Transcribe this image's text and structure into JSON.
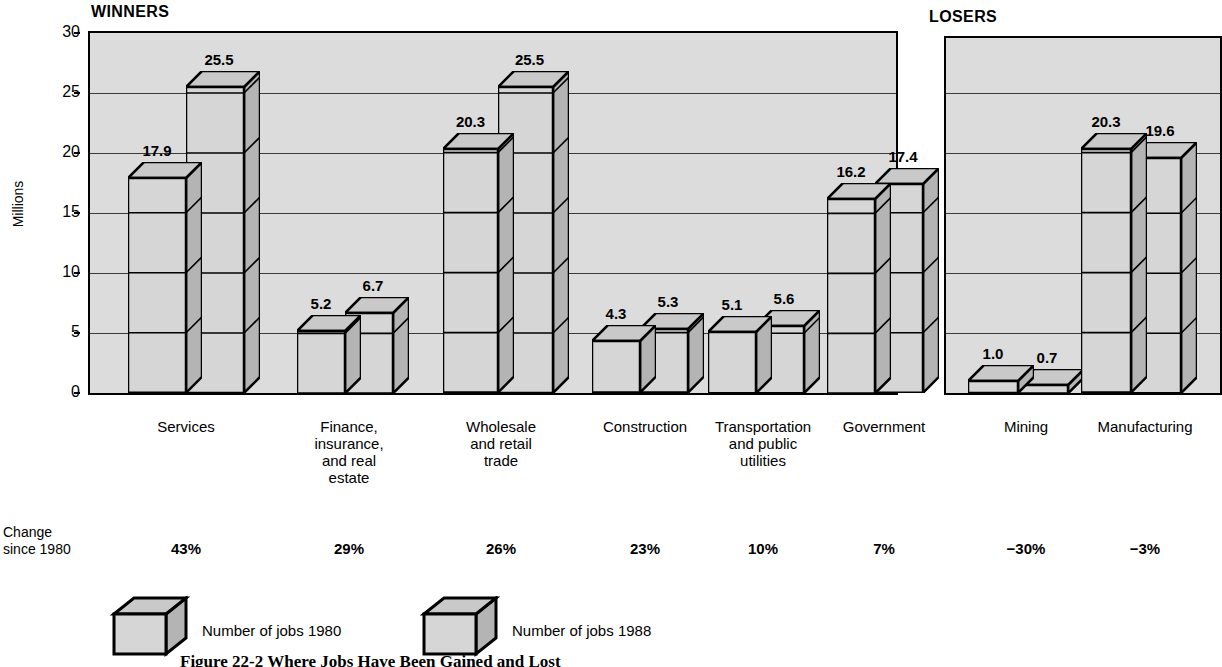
{
  "figure": {
    "ylabel": "Millions",
    "caption": "Figure 22-2   Where Jobs Have Been Gained and Lost",
    "change_label": "Change\nsince 1980",
    "panels": [
      {
        "name": "winners",
        "title": "WINNERS"
      },
      {
        "name": "losers",
        "title": "LOSERS"
      }
    ],
    "legend": [
      {
        "name": "legend-1980",
        "label": "Number of jobs 1980"
      },
      {
        "name": "legend-1988",
        "label": "Number of jobs 1988"
      }
    ]
  },
  "chart_data": {
    "type": "bar",
    "title": "Where Jobs Have Been Gained and Lost",
    "subtitle": "",
    "xlabel": "",
    "ylabel": "Millions",
    "ylim": [
      0,
      30
    ],
    "yticks": [
      0,
      5,
      10,
      15,
      20,
      25,
      30
    ],
    "grid": true,
    "legend_position": "bottom-left",
    "series": [
      {
        "name": "Number of jobs 1980",
        "values": [
          17.9,
          5.2,
          20.3,
          4.3,
          5.1,
          16.2,
          1.0,
          20.3
        ]
      },
      {
        "name": "Number of jobs 1988",
        "values": [
          25.5,
          6.7,
          25.5,
          5.3,
          5.6,
          17.4,
          0.7,
          19.6
        ]
      }
    ],
    "categories": [
      "Services",
      "Finance,\ninsurance,\nand real\nestate",
      "Wholesale\nand retail\ntrade",
      "Construction",
      "Transportation\nand public\nutilities",
      "Government",
      "Mining",
      "Manufacturing"
    ],
    "annotations": {
      "change_since_1980": [
        "43%",
        "29%",
        "26%",
        "23%",
        "10%",
        "7%",
        "−30%",
        "−3%"
      ]
    },
    "groups": [
      {
        "label": "WINNERS",
        "categories": [
          "Services",
          "Finance, insurance, and real estate",
          "Wholesale and retail trade",
          "Construction",
          "Transportation and public utilities",
          "Government"
        ]
      },
      {
        "label": "LOSERS",
        "categories": [
          "Mining",
          "Manufacturing"
        ]
      }
    ]
  },
  "bars": [
    {
      "cat_index": 0,
      "value": "17.9",
      "series": 0
    },
    {
      "cat_index": 0,
      "value": "25.5",
      "series": 1
    },
    {
      "cat_index": 1,
      "value": "5.2",
      "series": 0
    },
    {
      "cat_index": 1,
      "value": "6.7",
      "series": 1
    },
    {
      "cat_index": 2,
      "value": "20.3",
      "series": 0
    },
    {
      "cat_index": 2,
      "value": "25.5",
      "series": 1
    },
    {
      "cat_index": 3,
      "value": "4.3",
      "series": 0
    },
    {
      "cat_index": 3,
      "value": "5.3",
      "series": 1
    },
    {
      "cat_index": 4,
      "value": "5.1",
      "series": 0
    },
    {
      "cat_index": 4,
      "value": "5.6",
      "series": 1
    },
    {
      "cat_index": 5,
      "value": "16.2",
      "series": 0
    },
    {
      "cat_index": 5,
      "value": "17.4",
      "series": 1
    },
    {
      "cat_index": 6,
      "value": "1.0",
      "series": 0
    },
    {
      "cat_index": 6,
      "value": "0.7",
      "series": 1
    },
    {
      "cat_index": 7,
      "value": "20.3",
      "series": 0
    },
    {
      "cat_index": 7,
      "value": "19.6",
      "series": 1
    }
  ],
  "colors": {
    "plot_background": "#dcdcdc",
    "bar_front": "#d6d6d6",
    "bar_side": "#b4b4b4",
    "bar_top": "#c9c9c9",
    "outline": "#000000",
    "gridline": "#3a3a3a",
    "page_background": "#ffffff"
  }
}
